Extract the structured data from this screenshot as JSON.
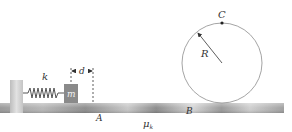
{
  "figure": {
    "type": "physics-diagram"
  },
  "labels": {
    "spring_constant": "k",
    "mass": "m",
    "displacement": "d",
    "point_a": "A",
    "point_b": "B",
    "point_c": "C",
    "radius": "R",
    "friction_mu": "μ",
    "friction_sub": "k"
  },
  "colors": {
    "background": "#ffffff",
    "track_dark": "#8f8f8f",
    "track_light": "#d8d8d8",
    "wall": "#c8c8c8",
    "block": "#8a8a8a",
    "spring": "#555555",
    "loop": "#9a9a9a",
    "text": "#333333"
  }
}
